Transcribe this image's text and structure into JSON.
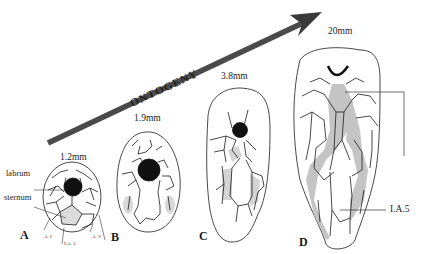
{
  "figure": {
    "arrow_label": "ONTOGENY",
    "colors": {
      "line": "#1a1a1a",
      "arrow": "#4a4a4a",
      "shading": "#c8c8c8",
      "dark_shading": "#b0b0b0",
      "mouth": "#111111"
    },
    "panels": [
      {
        "letter": "A",
        "size": "1.2mm"
      },
      {
        "letter": "B",
        "size": "1.9mm"
      },
      {
        "letter": "C",
        "size": "3.8mm"
      },
      {
        "letter": "D",
        "size": "20mm"
      }
    ],
    "labels": {
      "labrum": "labrum",
      "sternum": "sternum",
      "ai": "A. I",
      "ia5_small": "I.A. 5",
      "av": "A. V",
      "ia5": "I.A.5"
    }
  }
}
